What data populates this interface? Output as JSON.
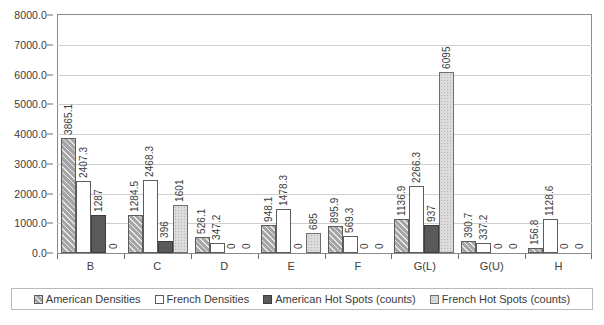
{
  "chart_data": {
    "type": "bar",
    "title": "",
    "subtitle": "",
    "xlabel": "",
    "ylabel": "",
    "grid": true,
    "legend_position": "bottom",
    "ylim": [
      0,
      8000
    ],
    "ytick_step": 1000,
    "ytick_labels": [
      "0.0",
      "1000.0",
      "2000.0",
      "3000.0",
      "4000.0",
      "5000.0",
      "6000.0",
      "7000.0",
      "8000.0"
    ],
    "ytick_values": [
      0,
      1000,
      2000,
      3000,
      4000,
      5000,
      6000,
      7000,
      8000
    ],
    "categories": [
      "B",
      "C",
      "D",
      "E",
      "F",
      "G(L)",
      "G(U)",
      "H"
    ],
    "series": [
      {
        "name": "American Densities",
        "swatch": "s0",
        "values": [
          3865.1,
          1284.5,
          526.1,
          948.1,
          895.9,
          1136.9,
          390.7,
          156.8
        ],
        "labels": [
          "3865.1",
          "1284.5",
          "526.1",
          "948.1",
          "895.9",
          "1136.9",
          "390.7",
          "156.8"
        ]
      },
      {
        "name": "French Densities",
        "swatch": "s1",
        "values": [
          2407.3,
          2468.3,
          347.2,
          1478.3,
          569.3,
          2266.3,
          337.2,
          1128.6
        ],
        "labels": [
          "2407.3",
          "2468.3",
          "347.2",
          "1478.3",
          "569.3",
          "2266.3",
          "337.2",
          "1128.6"
        ]
      },
      {
        "name": "American Hot Spots (counts)",
        "swatch": "s2",
        "values": [
          1287,
          396,
          0,
          0,
          0,
          937,
          0,
          0
        ],
        "labels": [
          "1287",
          "396",
          "0",
          "0",
          "0",
          "937",
          "0",
          "0"
        ]
      },
      {
        "name": "French Hot Spots (counts)",
        "swatch": "s3",
        "values": [
          0,
          1601,
          0,
          685,
          0,
          6095,
          0,
          0
        ],
        "labels": [
          "0",
          "1601",
          "0",
          "685",
          "0",
          "6095",
          "0",
          "0"
        ]
      }
    ],
    "colors": {
      "american_densities": "#a5a5a5",
      "french_densities": "#ffffff",
      "american_hot_spots": "#5a5a5a",
      "french_hot_spots": "#dcdcdc",
      "gridline": "#cfcfcf",
      "axis": "#8a8a8a",
      "text": "#3b3b3b"
    }
  }
}
